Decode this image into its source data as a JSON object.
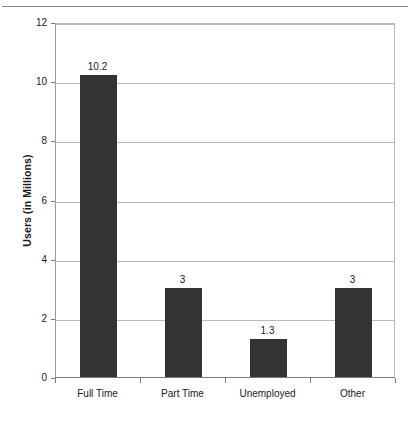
{
  "chart_data": {
    "type": "bar",
    "title": "",
    "xlabel": "",
    "ylabel": "Users (in Millions)",
    "categories": [
      "Full Time",
      "Part Time",
      "Unemployed",
      "Other"
    ],
    "values": [
      10.2,
      3,
      1.3,
      3
    ],
    "value_labels": [
      "10.2",
      "3",
      "1.3",
      "3"
    ],
    "ylim": [
      0,
      12
    ],
    "ytick_labels": [
      "0",
      "2",
      "4",
      "6",
      "8",
      "10",
      "12"
    ],
    "ytick_values": [
      0,
      2,
      4,
      6,
      8,
      10,
      12
    ],
    "grid": "horizontal",
    "legend": "none",
    "bar_color": "#333333",
    "gridline_color": "#b9b9b9",
    "axis_color": "#7a7a7a",
    "text_color": "#1a1a1a",
    "background_color": "#ffffff"
  },
  "decorations": {
    "top_rule_color": "#8a8a8a"
  }
}
